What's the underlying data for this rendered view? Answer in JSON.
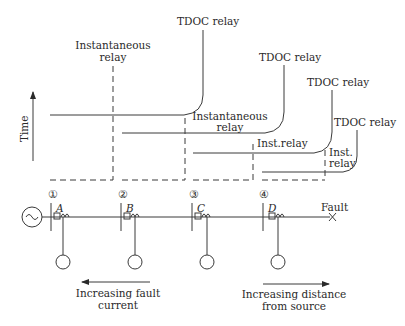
{
  "axis": {
    "y_label": "Time"
  },
  "curves": [
    {
      "id": "relay-1",
      "tdoc_label": "TDOC relay",
      "inst_label_line1": "Instantaneous",
      "inst_label_line2": "relay"
    },
    {
      "id": "relay-2",
      "tdoc_label": "TDOC relay",
      "inst_label_line1": "Instantaneous",
      "inst_label_line2": "relay"
    },
    {
      "id": "relay-3",
      "tdoc_label": "TDOC relay",
      "inst_label_line1": "Inst.relay"
    },
    {
      "id": "relay-4",
      "tdoc_label": "TDOC relay",
      "inst_label_line1": "Inst.",
      "inst_label_line2": "relay"
    }
  ],
  "buses": [
    {
      "number": "①",
      "breaker": "A"
    },
    {
      "number": "②",
      "breaker": "B"
    },
    {
      "number": "③",
      "breaker": "C"
    },
    {
      "number": "④",
      "breaker": "D"
    }
  ],
  "fault": {
    "label": "Fault",
    "marker": "×"
  },
  "source": {
    "symbol": "~"
  },
  "annotations": {
    "left_arrow_line1": "Increasing fault",
    "left_arrow_line2": "current",
    "right_arrow_line1": "Increasing distance",
    "right_arrow_line2": "from source"
  }
}
